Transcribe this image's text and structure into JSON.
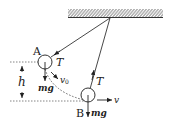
{
  "diagram": {
    "type": "pendulum-force-diagram",
    "labels": {
      "point_a": "A",
      "point_b": "B",
      "tension_a": "T",
      "tension_b": "T",
      "gravity_a": "mg",
      "gravity_b": "mg",
      "velocity_a": "v",
      "velocity_a_sub": "0",
      "velocity_b": "v",
      "height": "h"
    },
    "colors": {
      "stroke": "#333333",
      "background": "#ffffff"
    }
  }
}
